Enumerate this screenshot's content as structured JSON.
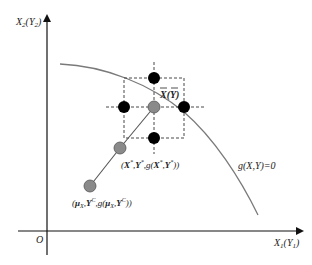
{
  "diagram": {
    "axes": {
      "y_label": "X₂(Y₂)",
      "x_label": "X₁(Y₁)",
      "origin_label": "O"
    },
    "curve_label": "g(X,Y)=0",
    "center_label": "X(Y)",
    "points": [
      {
        "name": "center-point",
        "x": 154,
        "y": 107,
        "fill": "#8a8a8a"
      },
      {
        "name": "top-point",
        "x": 154,
        "y": 78,
        "fill": "#000000"
      },
      {
        "name": "left-point",
        "x": 124,
        "y": 107,
        "fill": "#000000"
      },
      {
        "name": "right-point",
        "x": 184,
        "y": 107,
        "fill": "#000000"
      },
      {
        "name": "bottom-point",
        "x": 154,
        "y": 138,
        "fill": "#000000"
      },
      {
        "name": "iterate-point",
        "x": 120,
        "y": 148,
        "fill": "#8a8a8a"
      },
      {
        "name": "start-point",
        "x": 90,
        "y": 186,
        "fill": "#8a8a8a"
      }
    ],
    "iterate_label": "(X*, Y*, g(X*, Y*))",
    "start_label": "(μX, Yᶜ, g(μX, Yᶜ))",
    "colors": {
      "axis": "#111111",
      "curve": "#7a7a7a",
      "dashed": "#333333",
      "path": "#555555",
      "gray_point": "#8a8a8a",
      "black_point": "#000000"
    }
  }
}
